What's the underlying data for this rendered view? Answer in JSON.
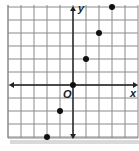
{
  "chart_data": {
    "type": "scatter",
    "title": "",
    "xlabel": "x",
    "ylabel": "y",
    "origin_label": "O",
    "grid": true,
    "xlim": [
      -5,
      5
    ],
    "ylim": [
      -4,
      6
    ],
    "points": [
      {
        "x": -2,
        "y": -4
      },
      {
        "x": -1,
        "y": -2
      },
      {
        "x": 0,
        "y": 0
      },
      {
        "x": 1,
        "y": 2
      },
      {
        "x": 2,
        "y": 4
      },
      {
        "x": 3,
        "y": 6
      }
    ]
  },
  "labels": {
    "x_axis": "x",
    "y_axis": "y",
    "origin": "O"
  },
  "colors": {
    "grid": "#8a8a8a",
    "axis": "#222222",
    "point": "#111111",
    "shadow": "#cfcfcf"
  }
}
